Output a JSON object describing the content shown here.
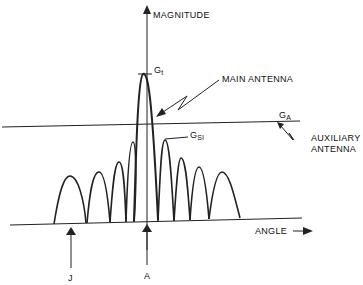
{
  "axes": {
    "y_label": "MAGNITUDE",
    "x_label": "ANGLE"
  },
  "labels": {
    "gt": {
      "main": "G",
      "sub": "t"
    },
    "ga": {
      "main": "G",
      "sub": "A"
    },
    "gsl": {
      "main": "G",
      "sub": "Sl"
    },
    "main_antenna": "MAIN ANTENNA",
    "aux_line1": "AUXILIARY",
    "aux_line2": "ANTENNA",
    "marker_j": "J",
    "marker_a": "A"
  },
  "colors": {
    "ink": "#222222",
    "background": "#ffffff"
  }
}
